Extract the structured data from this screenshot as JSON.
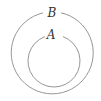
{
  "diagram": {
    "type": "venn-subset",
    "sets": [
      {
        "id": "outer",
        "label": "B",
        "cx": 52,
        "cy": 53,
        "r": 41
      },
      {
        "id": "inner",
        "label": "A",
        "cx": 54,
        "cy": 61,
        "r": 26
      }
    ],
    "colors": {
      "stroke": "#8a8a8a",
      "label": "#333333",
      "background": "#ffffff"
    }
  }
}
